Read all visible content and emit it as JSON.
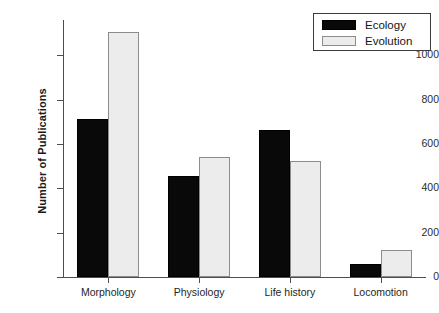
{
  "chart_data": {
    "type": "bar",
    "title": "",
    "xlabel": "",
    "ylabel": "Number of Publications",
    "categories": [
      "Morphology",
      "Physiology",
      "Life history",
      "Locomotion"
    ],
    "series": [
      {
        "name": "Ecology",
        "color": "#090909",
        "values": [
          715,
          455,
          665,
          60
        ]
      },
      {
        "name": "Evolution",
        "color": "#ececec",
        "values": [
          1105,
          540,
          525,
          120
        ]
      }
    ],
    "ylim": [
      0,
      1160
    ],
    "yticks": [
      0,
      200,
      400,
      600,
      800,
      1000
    ],
    "ytick_labels": [
      "0",
      "200",
      "400",
      "600",
      "800",
      "1000"
    ],
    "grid": false,
    "legend_position": "top-right"
  },
  "legend": {
    "entries": [
      {
        "label": "Ecology"
      },
      {
        "label": "Evolution"
      }
    ]
  }
}
